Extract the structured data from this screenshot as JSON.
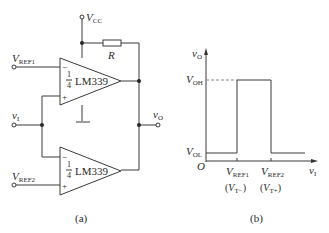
{
  "figure_a": {
    "caption": "(a)",
    "supply": {
      "symbol": "V",
      "subscript": "CC"
    },
    "resistor": {
      "label": "R"
    },
    "comparator_upper": {
      "fraction_num": "1",
      "fraction_den": "4",
      "part": "LM339",
      "inverting": "−",
      "noninverting": "+"
    },
    "comparator_lower": {
      "fraction_num": "1",
      "fraction_den": "4",
      "part": "LM339",
      "inverting": "−",
      "noninverting": "+"
    },
    "input_ref1": {
      "symbol": "V",
      "subscript": "REF1"
    },
    "input_ref2": {
      "symbol": "V",
      "subscript": "REF2"
    },
    "input_vi": {
      "symbol": "v",
      "subscript": "I"
    },
    "output_vo": {
      "symbol": "v",
      "subscript": "O"
    }
  },
  "figure_b": {
    "caption": "(b)",
    "y_axis": {
      "symbol": "v",
      "subscript": "O"
    },
    "x_axis": {
      "symbol": "v",
      "subscript": "I"
    },
    "origin": "O",
    "level_high": {
      "symbol": "V",
      "subscript": "OH"
    },
    "level_low": {
      "symbol": "V",
      "subscript": "OL"
    },
    "threshold_1": {
      "symbol": "V",
      "subscript": "REF1",
      "alt_symbol": "V",
      "alt_subscript": "T−"
    },
    "threshold_2": {
      "symbol": "V",
      "subscript": "REF2",
      "alt_symbol": "V",
      "alt_subscript": "T+"
    }
  }
}
